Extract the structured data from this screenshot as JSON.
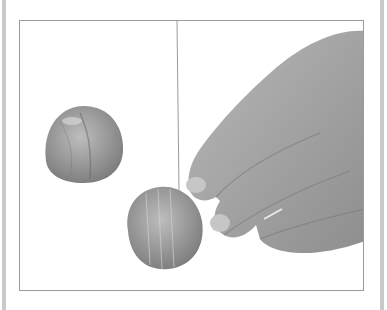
{
  "figure": {
    "alt": "Hand holding a shallot while a knife slices it vertically; a second halved shallot sits to the left",
    "colors": {
      "background": "#ffffff",
      "frame_border": "#9a9a9a",
      "side_bars": "#c9c9c9",
      "hand": "#a9a9a9",
      "shallot": "#9c9c9c"
    }
  }
}
